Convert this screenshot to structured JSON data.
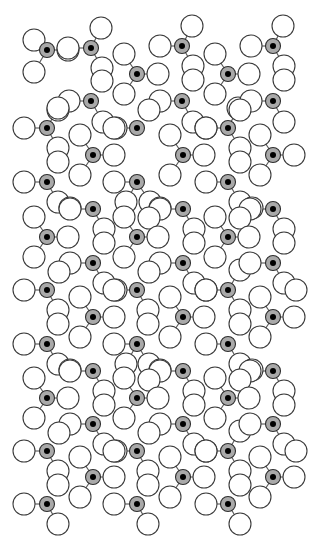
{
  "diagram": {
    "type": "crystal-lattice-structure",
    "background": "#ffffff",
    "colors": {
      "center_fill": "#a9a9a9",
      "center_core": "#000000",
      "ligand_fill": "#ffffff",
      "outline": "#3a3a3a",
      "bond": "#555555"
    },
    "sizes": {
      "center_radius": 7.5,
      "core_radius": 3,
      "ligand_radius": 11
    },
    "lattice": {
      "cell_w": 90,
      "cell_h": 81,
      "cols_x": [
        47,
        93,
        139,
        185,
        231,
        277
      ],
      "rows": 7
    },
    "molecules": [
      {
        "c": [
          47,
          50
        ],
        "l": [
          [
            34,
            40
          ],
          [
            68,
            50
          ],
          [
            34,
            72
          ]
        ]
      },
      {
        "c": [
          91,
          48
        ],
        "l": [
          [
            68,
            48
          ],
          [
            101,
            28
          ],
          [
            102,
            68
          ],
          [
            102,
            81
          ]
        ]
      },
      {
        "c": [
          137,
          74
        ],
        "l": [
          [
            124,
            54
          ],
          [
            158,
            74
          ],
          [
            124,
            94
          ]
        ]
      },
      {
        "c": [
          182,
          46
        ],
        "l": [
          [
            160,
            46
          ],
          [
            192,
            26
          ],
          [
            193,
            66
          ],
          [
            193,
            80
          ]
        ]
      },
      {
        "c": [
          228,
          74
        ],
        "l": [
          [
            215,
            54
          ],
          [
            249,
            74
          ],
          [
            215,
            94
          ]
        ]
      },
      {
        "c": [
          273,
          46
        ],
        "l": [
          [
            251,
            46
          ],
          [
            283,
            26
          ],
          [
            284,
            66
          ],
          [
            284,
            80
          ]
        ]
      },
      {
        "c": [
          91,
          101
        ],
        "l": [
          [
            69,
            101
          ],
          [
            58,
            110
          ],
          [
            103,
            122
          ],
          [
            116,
            128
          ]
        ]
      },
      {
        "c": [
          47,
          128
        ],
        "l": [
          [
            24,
            128
          ],
          [
            58,
            108
          ],
          [
            58,
            148
          ],
          [
            58,
            162
          ]
        ]
      },
      {
        "c": [
          182,
          101
        ],
        "l": [
          [
            160,
            101
          ],
          [
            149,
            110
          ],
          [
            193,
            122
          ],
          [
            206,
            128
          ]
        ]
      },
      {
        "c": [
          137,
          128
        ],
        "l": [
          [
            114,
            128
          ]
        ]
      },
      {
        "c": [
          228,
          128
        ],
        "l": [
          [
            206,
            128
          ],
          [
            240,
            148
          ],
          [
            240,
            162
          ],
          [
            238,
            108
          ]
        ]
      },
      {
        "c": [
          273,
          101
        ],
        "l": [
          [
            251,
            101
          ],
          [
            240,
            110
          ],
          [
            284,
            122
          ]
        ]
      },
      {
        "c": [
          93,
          155
        ],
        "l": [
          [
            80,
            135
          ],
          [
            114,
            155
          ],
          [
            80,
            175
          ]
        ]
      },
      {
        "c": [
          183,
          155
        ],
        "l": [
          [
            170,
            135
          ],
          [
            204,
            155
          ],
          [
            170,
            175
          ]
        ]
      },
      {
        "c": [
          273,
          155
        ],
        "l": [
          [
            260,
            135
          ],
          [
            294,
            155
          ],
          [
            260,
            175
          ]
        ]
      },
      {
        "c": [
          47,
          182
        ],
        "l": [
          [
            24,
            182
          ],
          [
            58,
            202
          ],
          [
            70,
            208
          ]
        ]
      },
      {
        "c": [
          137,
          182
        ],
        "l": [
          [
            114,
            182
          ],
          [
            126,
            202
          ],
          [
            150,
            202
          ],
          [
            160,
            208
          ]
        ]
      },
      {
        "c": [
          228,
          182
        ],
        "l": [
          [
            206,
            182
          ],
          [
            240,
            202
          ],
          [
            252,
            208
          ]
        ]
      },
      {
        "c": [
          93,
          209
        ],
        "l": [
          [
            70,
            209
          ],
          [
            104,
            229
          ],
          [
            104,
            243
          ]
        ]
      },
      {
        "c": [
          183,
          209
        ],
        "l": [
          [
            160,
            209
          ],
          [
            149,
            218
          ],
          [
            194,
            229
          ],
          [
            194,
            243
          ]
        ]
      },
      {
        "c": [
          273,
          209
        ],
        "l": [
          [
            250,
            209
          ],
          [
            240,
            218
          ],
          [
            284,
            229
          ],
          [
            284,
            243
          ]
        ]
      },
      {
        "c": [
          47,
          237
        ],
        "l": [
          [
            34,
            217
          ],
          [
            68,
            237
          ],
          [
            34,
            257
          ]
        ]
      },
      {
        "c": [
          137,
          237
        ],
        "l": [
          [
            124,
            217
          ],
          [
            158,
            237
          ],
          [
            124,
            257
          ]
        ]
      },
      {
        "c": [
          228,
          237
        ],
        "l": [
          [
            215,
            217
          ],
          [
            249,
            237
          ],
          [
            215,
            257
          ]
        ]
      },
      {
        "c": [
          93,
          263
        ],
        "l": [
          [
            70,
            263
          ],
          [
            59,
            272
          ],
          [
            104,
            283
          ],
          [
            116,
            290
          ]
        ]
      },
      {
        "c": [
          47,
          290
        ],
        "l": [
          [
            24,
            290
          ],
          [
            58,
            310
          ],
          [
            58,
            324
          ]
        ]
      },
      {
        "c": [
          137,
          290
        ],
        "l": [
          [
            114,
            290
          ],
          [
            148,
            310
          ],
          [
            148,
            324
          ]
        ]
      },
      {
        "c": [
          183,
          263
        ],
        "l": [
          [
            160,
            263
          ],
          [
            149,
            272
          ],
          [
            194,
            283
          ],
          [
            206,
            290
          ]
        ]
      },
      {
        "c": [
          228,
          290
        ],
        "l": [
          [
            206,
            290
          ],
          [
            240,
            310
          ],
          [
            240,
            324
          ],
          [
            240,
            270
          ]
        ]
      },
      {
        "c": [
          273,
          263
        ],
        "l": [
          [
            250,
            263
          ],
          [
            284,
            283
          ],
          [
            296,
            290
          ]
        ]
      },
      {
        "c": [
          93,
          317
        ],
        "l": [
          [
            80,
            297
          ],
          [
            114,
            317
          ],
          [
            80,
            337
          ]
        ]
      },
      {
        "c": [
          183,
          317
        ],
        "l": [
          [
            170,
            297
          ],
          [
            204,
            317
          ],
          [
            170,
            337
          ]
        ]
      },
      {
        "c": [
          273,
          317
        ],
        "l": [
          [
            260,
            297
          ],
          [
            294,
            317
          ],
          [
            260,
            337
          ]
        ]
      },
      {
        "c": [
          47,
          344
        ],
        "l": [
          [
            24,
            344
          ],
          [
            58,
            364
          ],
          [
            70,
            370
          ]
        ]
      },
      {
        "c": [
          137,
          344
        ],
        "l": [
          [
            114,
            344
          ],
          [
            126,
            364
          ],
          [
            149,
            364
          ],
          [
            160,
            370
          ]
        ]
      },
      {
        "c": [
          228,
          344
        ],
        "l": [
          [
            206,
            344
          ],
          [
            240,
            364
          ],
          [
            252,
            370
          ]
        ]
      },
      {
        "c": [
          93,
          371
        ],
        "l": [
          [
            70,
            371
          ],
          [
            104,
            391
          ],
          [
            104,
            405
          ]
        ]
      },
      {
        "c": [
          183,
          371
        ],
        "l": [
          [
            160,
            371
          ],
          [
            149,
            380
          ],
          [
            194,
            391
          ],
          [
            194,
            405
          ]
        ]
      },
      {
        "c": [
          273,
          371
        ],
        "l": [
          [
            250,
            371
          ],
          [
            240,
            380
          ],
          [
            284,
            391
          ],
          [
            284,
            405
          ]
        ]
      },
      {
        "c": [
          47,
          398
        ],
        "l": [
          [
            34,
            378
          ],
          [
            68,
            398
          ],
          [
            34,
            418
          ]
        ]
      },
      {
        "c": [
          137,
          398
        ],
        "l": [
          [
            124,
            378
          ],
          [
            158,
            398
          ],
          [
            124,
            418
          ]
        ]
      },
      {
        "c": [
          228,
          398
        ],
        "l": [
          [
            215,
            378
          ],
          [
            249,
            398
          ],
          [
            215,
            418
          ]
        ]
      },
      {
        "c": [
          93,
          424
        ],
        "l": [
          [
            70,
            424
          ],
          [
            59,
            433
          ],
          [
            104,
            444
          ],
          [
            116,
            451
          ]
        ]
      },
      {
        "c": [
          47,
          451
        ],
        "l": [
          [
            24,
            451
          ],
          [
            58,
            471
          ],
          [
            58,
            485
          ]
        ]
      },
      {
        "c": [
          137,
          451
        ],
        "l": [
          [
            114,
            451
          ],
          [
            148,
            471
          ],
          [
            148,
            485
          ]
        ]
      },
      {
        "c": [
          183,
          424
        ],
        "l": [
          [
            160,
            424
          ],
          [
            149,
            433
          ],
          [
            194,
            444
          ],
          [
            206,
            451
          ]
        ]
      },
      {
        "c": [
          228,
          451
        ],
        "l": [
          [
            206,
            451
          ],
          [
            240,
            471
          ],
          [
            240,
            485
          ],
          [
            240,
            431
          ]
        ]
      },
      {
        "c": [
          273,
          424
        ],
        "l": [
          [
            250,
            424
          ],
          [
            284,
            444
          ],
          [
            296,
            451
          ]
        ]
      },
      {
        "c": [
          93,
          477
        ],
        "l": [
          [
            80,
            457
          ],
          [
            114,
            477
          ],
          [
            80,
            497
          ]
        ]
      },
      {
        "c": [
          183,
          477
        ],
        "l": [
          [
            170,
            457
          ],
          [
            204,
            477
          ],
          [
            170,
            497
          ]
        ]
      },
      {
        "c": [
          273,
          477
        ],
        "l": [
          [
            260,
            457
          ],
          [
            294,
            477
          ],
          [
            260,
            497
          ]
        ]
      },
      {
        "c": [
          47,
          504
        ],
        "l": [
          [
            24,
            504
          ],
          [
            58,
            524
          ]
        ]
      },
      {
        "c": [
          137,
          504
        ],
        "l": [
          [
            114,
            504
          ],
          [
            148,
            524
          ]
        ]
      },
      {
        "c": [
          228,
          504
        ],
        "l": [
          [
            206,
            504
          ],
          [
            240,
            524
          ]
        ]
      }
    ]
  }
}
